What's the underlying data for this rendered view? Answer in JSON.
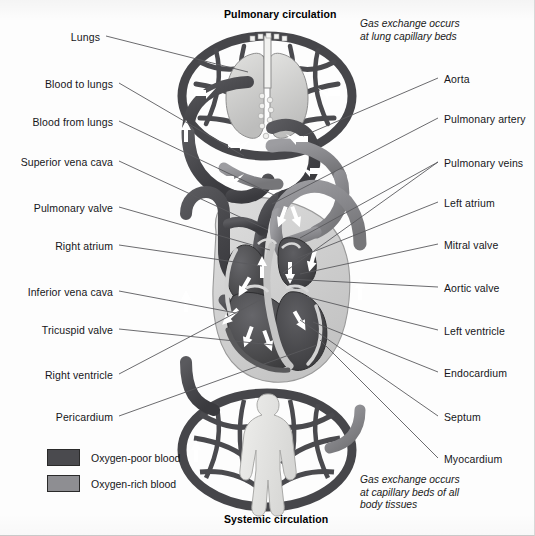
{
  "diagram": {
    "title_top": "Pulmonary circulation",
    "title_bottom": "Systemic circulation",
    "note_top": "Gas exchange occurs\nat lung capillary beds",
    "note_bottom": "Gas exchange occurs\nat capillary beds of all\nbody tissues"
  },
  "labels_left": [
    {
      "text": "Lungs",
      "y": 32,
      "tx": 100,
      "ty": 36,
      "lx": 248,
      "ly": 72
    },
    {
      "text": "Blood to lungs",
      "y": 79,
      "tx": 113,
      "ty": 83,
      "lx": 244,
      "ly": 156
    },
    {
      "text": "Blood from lungs",
      "y": 117,
      "tx": 113,
      "ty": 121,
      "lx": 276,
      "ly": 196
    },
    {
      "text": "Superior vena cava",
      "y": 157,
      "tx": 113,
      "ty": 161,
      "lx": 268,
      "ly": 230
    },
    {
      "text": "Pulmonary valve",
      "y": 203,
      "tx": 113,
      "ty": 207,
      "lx": 270,
      "ly": 250
    },
    {
      "text": "Right atrium",
      "y": 241,
      "tx": 113,
      "ty": 245,
      "lx": 262,
      "ly": 266
    },
    {
      "text": "Inferior vena cava",
      "y": 287,
      "tx": 113,
      "ty": 291,
      "lx": 236,
      "ly": 313
    },
    {
      "text": "Tricuspid valve",
      "y": 325,
      "tx": 113,
      "ty": 329,
      "lx": 273,
      "ly": 345
    },
    {
      "text": "Right ventricle",
      "y": 370,
      "tx": 113,
      "ty": 374,
      "lx": 262,
      "ly": 299
    },
    {
      "text": "Pericardium",
      "y": 412,
      "tx": 113,
      "ty": 416,
      "lx": 317,
      "ly": 345
    }
  ],
  "labels_right": [
    {
      "text": "Aorta",
      "y": 74,
      "tx": 444,
      "ty": 78,
      "lx": 303,
      "ly": 136
    },
    {
      "text": "Pulmonary artery",
      "y": 114,
      "tx": 444,
      "ty": 118,
      "lx": 272,
      "ly": 204
    },
    {
      "text": "Pulmonary veins",
      "y": 158,
      "tx": 444,
      "ty": 162,
      "lx": 300,
      "ly": 238
    },
    {
      "text": "Pulmonary veins2",
      "y": 158,
      "tx": 444,
      "ty": 162,
      "lx": 283,
      "ly": 273
    },
    {
      "text": "Left atrium",
      "y": 198,
      "tx": 444,
      "ty": 202,
      "lx": 295,
      "ly": 259
    },
    {
      "text": "Mitral valve",
      "y": 240,
      "tx": 444,
      "ty": 244,
      "lx": 300,
      "ly": 274
    },
    {
      "text": "Aortic valve",
      "y": 283,
      "tx": 444,
      "ty": 287,
      "lx": 288,
      "ly": 279
    },
    {
      "text": "Left ventricle",
      "y": 326,
      "tx": 444,
      "ty": 330,
      "lx": 307,
      "ly": 297
    },
    {
      "text": "Endocardium",
      "y": 368,
      "tx": 444,
      "ty": 372,
      "lx": 313,
      "ly": 322
    },
    {
      "text": "Septum",
      "y": 412,
      "tx": 444,
      "ty": 416,
      "lx": 300,
      "ly": 320
    },
    {
      "text": "Myocardium",
      "y": 454,
      "tx": 444,
      "ty": 458,
      "lx": 320,
      "ly": 340
    }
  ],
  "legend": {
    "items": [
      {
        "label": "Oxygen-poor blood",
        "color": "#4a4a4e"
      },
      {
        "label": "Oxygen-rich blood",
        "color": "#8e8e92"
      }
    ]
  },
  "colors": {
    "deoxygenated": "#4a4a4e",
    "oxygenated": "#8e8e92",
    "leader_line": "#5a5a5e",
    "outline": "#2b2b2e",
    "body_fill": "#e6e6e4",
    "lung_fill": "#cccccb",
    "heart_light": "#cfcfce",
    "background": "#fdfdfd"
  },
  "chart_data": {
    "type": "diagram",
    "annotations": [
      "Pulmonary circulation",
      "Systemic circulation",
      "Gas exchange occurs at lung capillary beds",
      "Gas exchange occurs at capillary beds of all body tissues"
    ]
  }
}
